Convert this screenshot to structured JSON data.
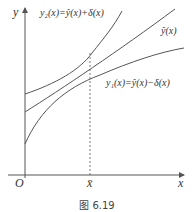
{
  "figure": {
    "caption": "图 6.19",
    "axes": {
      "y_label": "y",
      "x_label": "x",
      "origin_label": "O",
      "xbar_label": "x̄"
    },
    "curves": {
      "upper": {
        "label": "y₂(x)=ŷ(x)+δ(x)"
      },
      "middle": {
        "label": "ŷ(x)"
      },
      "lower": {
        "label": "y₁(x)=ŷ(x)−δ(x)"
      }
    },
    "colors": {
      "line": "#555555",
      "text": "#333333",
      "background": "#ffffff"
    }
  }
}
